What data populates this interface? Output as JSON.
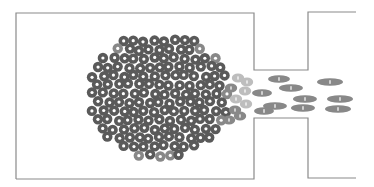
{
  "diagram": {
    "colors": {
      "background": "#ffffff",
      "wall": "#8a8a8a",
      "particle_dark": "#5a5a5a",
      "particle_mid": "#888888",
      "particle_light": "#bdbdbd",
      "particle_center": "#ffffff"
    },
    "walls": {
      "outline_points": "16,179 16,13 254,13 254,70 308,70 308,12 356,12",
      "outline_bottom_points": "16,179 254,179 254,118 308,118 308,178 356,178"
    },
    "cluster": {
      "center_x": 160,
      "center_y": 96,
      "radius_x": 72,
      "radius_y": 64,
      "particle_radius": 5.2
    },
    "transition_particles": [
      {
        "x": 238,
        "y": 78,
        "shade": "light"
      },
      {
        "x": 247,
        "y": 82,
        "shade": "light"
      },
      {
        "x": 231,
        "y": 88,
        "shade": "mid"
      },
      {
        "x": 245,
        "y": 91,
        "shade": "light"
      },
      {
        "x": 236,
        "y": 99,
        "shade": "light"
      },
      {
        "x": 246,
        "y": 104,
        "shade": "light"
      },
      {
        "x": 235,
        "y": 110,
        "shade": "mid"
      },
      {
        "x": 240,
        "y": 116,
        "shade": "mid"
      },
      {
        "x": 229,
        "y": 120,
        "shade": "mid"
      }
    ],
    "ellipses": [
      {
        "x": 279,
        "y": 79,
        "rx": 11,
        "ry": 3.8,
        "shade": "mid"
      },
      {
        "x": 291,
        "y": 88,
        "rx": 12,
        "ry": 3.8,
        "shade": "mid"
      },
      {
        "x": 330,
        "y": 82,
        "rx": 13,
        "ry": 3.8,
        "shade": "mid"
      },
      {
        "x": 262,
        "y": 93,
        "rx": 10,
        "ry": 3.8,
        "shade": "mid"
      },
      {
        "x": 305,
        "y": 99,
        "rx": 12,
        "ry": 3.8,
        "shade": "mid"
      },
      {
        "x": 340,
        "y": 99,
        "rx": 13,
        "ry": 3.8,
        "shade": "mid"
      },
      {
        "x": 275,
        "y": 106,
        "rx": 12,
        "ry": 3.8,
        "shade": "mid"
      },
      {
        "x": 303,
        "y": 108,
        "rx": 12,
        "ry": 3.8,
        "shade": "mid"
      },
      {
        "x": 338,
        "y": 109,
        "rx": 13,
        "ry": 3.8,
        "shade": "mid"
      },
      {
        "x": 264,
        "y": 111,
        "rx": 10,
        "ry": 3.8,
        "shade": "mid"
      }
    ]
  }
}
